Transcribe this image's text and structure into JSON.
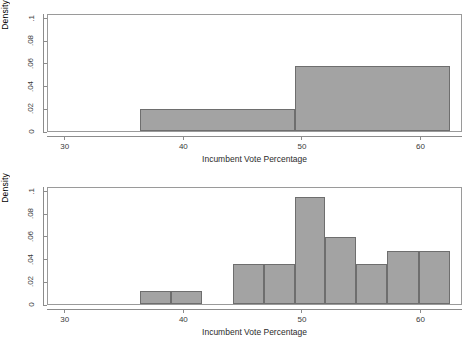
{
  "figure": {
    "background": "#ffffff",
    "bar_fill": "#a3a3a3",
    "bar_stroke": "#6e6e6e",
    "axis_color": "#8c8c8c"
  },
  "panels": [
    {
      "id": "top",
      "ylabel": "Density",
      "xlabel": "Incumbent Vote Percentage",
      "yticks": [
        "0",
        ".02",
        ".04",
        ".06",
        ".08",
        ".1"
      ],
      "ytick_values": [
        0,
        0.02,
        0.04,
        0.06,
        0.08,
        0.1
      ],
      "xticks": [
        "30",
        "40",
        "50",
        "60"
      ],
      "xtick_values": [
        30,
        40,
        50,
        60
      ]
    },
    {
      "id": "bottom",
      "ylabel": "Density",
      "xlabel": "Incumbent Vote Percentage",
      "yticks": [
        "0",
        ".02",
        ".04",
        ".06",
        ".08",
        ".1"
      ],
      "ytick_values": [
        0,
        0.02,
        0.04,
        0.06,
        0.08,
        0.1
      ],
      "xticks": [
        "30",
        "40",
        "50",
        "60"
      ],
      "xtick_values": [
        30,
        40,
        50,
        60
      ]
    }
  ],
  "chart_data": [
    {
      "type": "bar",
      "title": "",
      "subtitle": "",
      "xlabel": "Incumbent Vote Percentage",
      "ylabel": "Density",
      "xlim": [
        28.5,
        63.5
      ],
      "ylim": [
        0,
        0.104
      ],
      "grid": false,
      "legend": null,
      "orientation": "histogram",
      "bins": [
        {
          "left": 36.3,
          "right": 49.3,
          "density": 0.019
        },
        {
          "left": 49.3,
          "right": 62.4,
          "density": 0.0572
        }
      ]
    },
    {
      "type": "bar",
      "title": "",
      "subtitle": "",
      "xlabel": "Incumbent Vote Percentage",
      "ylabel": "Density",
      "xlim": [
        28.5,
        63.5
      ],
      "ylim": [
        0,
        0.104
      ],
      "grid": false,
      "legend": null,
      "orientation": "histogram",
      "bins": [
        {
          "left": 36.3,
          "right": 38.9,
          "density": 0.0116
        },
        {
          "left": 38.9,
          "right": 41.5,
          "density": 0.0116
        },
        {
          "left": 44.1,
          "right": 46.7,
          "density": 0.0352
        },
        {
          "left": 46.7,
          "right": 49.3,
          "density": 0.0352
        },
        {
          "left": 49.3,
          "right": 51.9,
          "density": 0.0943
        },
        {
          "left": 51.9,
          "right": 54.5,
          "density": 0.0588
        },
        {
          "left": 54.5,
          "right": 57.1,
          "density": 0.0352
        },
        {
          "left": 57.1,
          "right": 59.8,
          "density": 0.0468
        },
        {
          "left": 59.8,
          "right": 62.4,
          "density": 0.0468
        }
      ]
    }
  ]
}
